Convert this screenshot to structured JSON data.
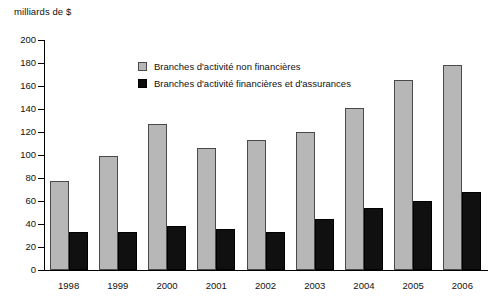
{
  "chart_data": {
    "type": "bar",
    "title": "",
    "subtitle": "",
    "xlabel": "",
    "ylabel": "milliards de $",
    "ylim": [
      0,
      200
    ],
    "ytick_step": 20,
    "yticks": [
      200,
      180,
      160,
      140,
      120,
      100,
      80,
      60,
      40,
      20,
      0
    ],
    "ytick_labels": [
      "200",
      "180",
      "160",
      "140",
      "120",
      "100",
      "80",
      "60",
      "40",
      "20",
      "0"
    ],
    "grid": false,
    "legend_position": "upper-center-left",
    "categories": [
      "1998",
      "1999",
      "2000",
      "2001",
      "2002",
      "2003",
      "2004",
      "2005",
      "2006"
    ],
    "series": [
      {
        "name": "Branches d'activité non financières",
        "color": "#b7b7b7",
        "edge_color": "#4a4a4a",
        "values": [
          77,
          99,
          127,
          106,
          113,
          120,
          141,
          165,
          178
        ]
      },
      {
        "name": "Branches d'activité financières et d'assurances",
        "color": "#101010",
        "edge_color": "#000000",
        "values": [
          33,
          33,
          38,
          36,
          33,
          44,
          54,
          60,
          68
        ]
      }
    ]
  },
  "axis": {
    "unit_label": "milliards de $"
  },
  "legend": {
    "items": [
      {
        "label": "Branches d'activité non financières",
        "swatch": "nonfin"
      },
      {
        "label": "Branches d'activité financières et d'assurances",
        "swatch": "fin"
      }
    ]
  }
}
